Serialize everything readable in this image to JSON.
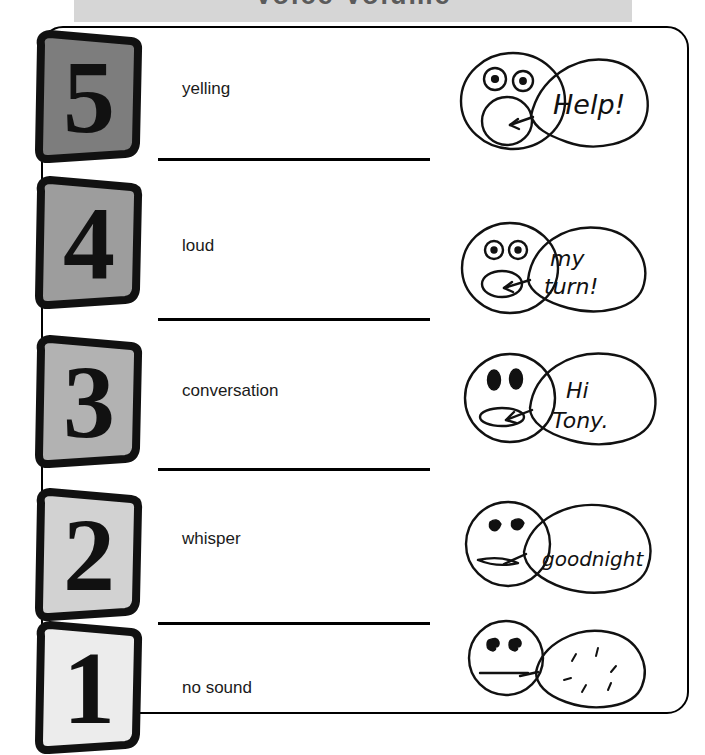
{
  "header": {
    "title": "Voice Volume",
    "band_color": "#d6d6d6"
  },
  "card": {
    "border_color": "#000000",
    "background": "#ffffff"
  },
  "scale": {
    "levels": [
      {
        "number": "5",
        "label": "yelling",
        "badge_color": "#7d7d7d",
        "bubble_text": "Help!",
        "mouth": "wide-open-round",
        "eyes": "dot-eyes",
        "face_icon": "yelling-face-icon"
      },
      {
        "number": "4",
        "label": "loud",
        "badge_color": "#9d9d9d",
        "bubble_text": "my turn!",
        "bubble_line1": "my",
        "bubble_line2": "turn!",
        "mouth": "open-oval",
        "eyes": "dot-eyes",
        "face_icon": "loud-face-icon"
      },
      {
        "number": "3",
        "label": "conversation",
        "badge_color": "#b2b2b2",
        "bubble_text": "Hi Tony.",
        "bubble_line1": "Hi",
        "bubble_line2": "Tony.",
        "mouth": "narrow-oval",
        "eyes": "filled-eyes",
        "face_icon": "conversation-face-icon"
      },
      {
        "number": "2",
        "label": "whisper",
        "badge_color": "#d2d2d2",
        "bubble_text": "goodnight",
        "mouth": "thin-slit",
        "eyes": "half-closed-eyes",
        "face_icon": "whisper-face-icon"
      },
      {
        "number": "1",
        "label": "no sound",
        "badge_color": "#ececec",
        "bubble_text": "",
        "mouth": "flat-line",
        "eyes": "comma-eyes",
        "face_icon": "no-sound-face-icon"
      }
    ]
  }
}
